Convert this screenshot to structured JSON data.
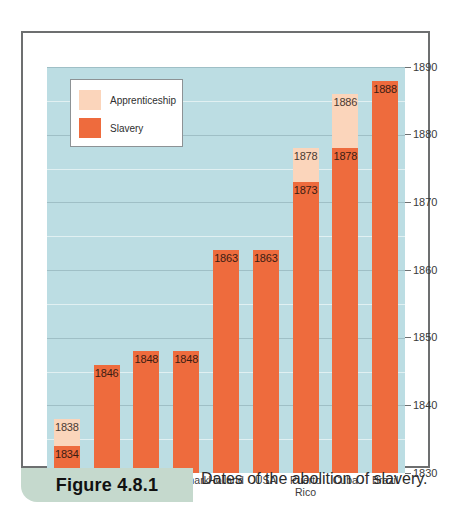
{
  "figure": {
    "tag": "Figure 4.8.1",
    "caption": "Dates of the abolition of slavery."
  },
  "legend": {
    "items": [
      {
        "label": "Apprenticeship",
        "color": "#fbd5bb"
      },
      {
        "label": "Slavery",
        "color": "#ee6b3d"
      }
    ]
  },
  "colors": {
    "plot_background": "#bcdde3",
    "slavery": "#ee6b3d",
    "apprenticeship": "#fbd5bb",
    "frame": "#6d6f70",
    "tag_background": "#c5d9cd"
  },
  "chart_data": {
    "type": "bar",
    "title": "Dates of the abolition of slavery.",
    "xlabel": "",
    "ylabel": "",
    "ylim": [
      1830,
      1890
    ],
    "ytick_values": [
      1830,
      1840,
      1850,
      1860,
      1870,
      1880,
      1890
    ],
    "ytick_labels": [
      "1830",
      "1840",
      "1850",
      "1860",
      "1870",
      "1880",
      "1890"
    ],
    "minor_gridlines": [
      1835,
      1845,
      1855,
      1865,
      1875,
      1885
    ],
    "grid": true,
    "legend_position": "top-left",
    "stacked": true,
    "categories": [
      "Britain",
      "Sweden",
      "France",
      "Denmark",
      "Holland",
      "USA",
      "Puerto Rico",
      "Cuba",
      "Brazil"
    ],
    "series": [
      {
        "name": "Slavery",
        "color": "#ee6b3d",
        "values": [
          1834,
          1846,
          1848,
          1848,
          1863,
          1863,
          1873,
          1878,
          1888
        ]
      },
      {
        "name": "Apprenticeship",
        "color": "#fbd5bb",
        "values": [
          1838,
          null,
          null,
          null,
          null,
          null,
          1878,
          1886,
          null
        ]
      }
    ],
    "bars": [
      {
        "category": "Britain",
        "slavery_end": 1834,
        "apprenticeship_end": 1838,
        "slavery_label": "1834",
        "apprenticeship_label": "1838"
      },
      {
        "category": "Sweden",
        "slavery_end": 1846,
        "apprenticeship_end": null,
        "slavery_label": "1846",
        "apprenticeship_label": ""
      },
      {
        "category": "France",
        "slavery_end": 1848,
        "apprenticeship_end": null,
        "slavery_label": "1848",
        "apprenticeship_label": ""
      },
      {
        "category": "Denmark",
        "slavery_end": 1848,
        "apprenticeship_end": null,
        "slavery_label": "1848",
        "apprenticeship_label": ""
      },
      {
        "category": "Holland",
        "slavery_end": 1863,
        "apprenticeship_end": null,
        "slavery_label": "1863",
        "apprenticeship_label": ""
      },
      {
        "category": "USA",
        "slavery_end": 1863,
        "apprenticeship_end": null,
        "slavery_label": "1863",
        "apprenticeship_label": ""
      },
      {
        "category": "Puerto Rico",
        "slavery_end": 1873,
        "apprenticeship_end": 1878,
        "slavery_label": "1873",
        "apprenticeship_label": "1878"
      },
      {
        "category": "Cuba",
        "slavery_end": 1878,
        "apprenticeship_end": 1886,
        "slavery_label": "1878",
        "apprenticeship_label": "1886"
      },
      {
        "category": "Brazil",
        "slavery_end": 1888,
        "apprenticeship_end": null,
        "slavery_label": "1888",
        "apprenticeship_label": ""
      }
    ]
  }
}
